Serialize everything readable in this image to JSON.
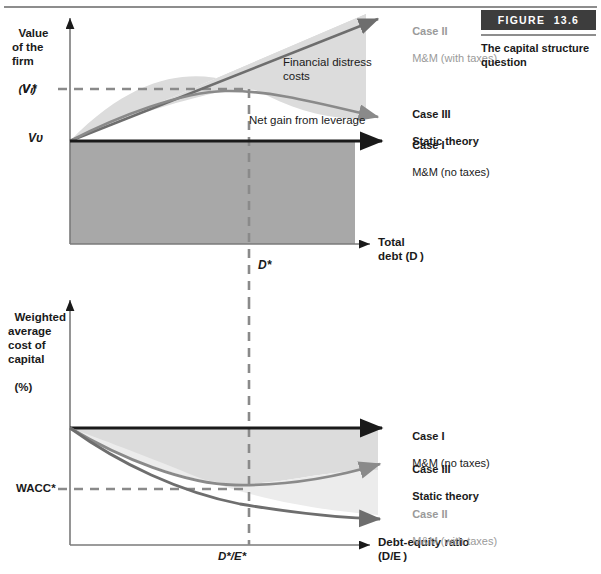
{
  "figure": {
    "badge_label": "FIGURE",
    "badge_number": "13.6",
    "caption": "The capital structure question"
  },
  "top_chart": {
    "y_axis_label_lines": [
      "Value",
      "of the",
      "firm"
    ],
    "y_axis_label_symbol": "(Vₗ)",
    "y_tick_vl": "Vₗ*",
    "y_tick_vu": "Vᴜ",
    "x_tick_dstar": "D*",
    "x_axis_label_lines": [
      "Total",
      "debt (D )"
    ],
    "annotation_distress": "Financial distress\ncosts",
    "annotation_netgain": "Net gain from leverage",
    "case2_line1": "Case II",
    "case2_line2": "M&M (with taxes)",
    "case3_line1": "Case III",
    "case3_line2": "Static theory",
    "case1_line1": "Case I",
    "case1_line2": "M&M (no taxes)"
  },
  "bottom_chart": {
    "y_axis_label_lines": [
      "Weighted",
      "average",
      "cost of",
      "capital"
    ],
    "y_axis_label_symbol": "(%)",
    "y_tick_wacc": "WACC*",
    "x_tick_destar": "D*/E*",
    "x_axis_label_lines": [
      "Debt-equity ratio",
      "(D/E )"
    ],
    "case1_line1": "Case I",
    "case1_line2": "M&M (no taxes)",
    "case3_line1": "Case III",
    "case3_line2": "Static theory",
    "case2_line1": "Case II",
    "case2_line2": "M&M (with taxes)"
  },
  "colors": {
    "dark_fill": "#a8a8a8",
    "light_fill": "#dcdcdc",
    "case1_stroke": "#1a1a1a",
    "case2_stroke": "#6e6e6e",
    "case3_stroke": "#8a8a8a",
    "dash_color": "#8a8a8a",
    "badge_bg": "#3d3d3d",
    "gray_text": "#9a9a9a",
    "rule": "#8d8d8d"
  },
  "chart_data": {
    "type": "line",
    "charts": [
      {
        "name": "value-of-firm-vs-debt",
        "title": "Value of the firm (V_L) vs Total debt (D)",
        "xlabel": "Total debt (D)",
        "ylabel": "Value of the firm (V_L)",
        "grid": false,
        "xlim": [
          0,
          1
        ],
        "ylim": [
          0,
          1
        ],
        "x_ticks": [
          {
            "value": 0.52,
            "label": "D*"
          }
        ],
        "y_ticks": [
          {
            "value": 0.53,
            "label": "V_L*"
          },
          {
            "value": 0.0,
            "label": "V_U"
          }
        ],
        "series": [
          {
            "name": "Case I - M&M (no taxes)",
            "color": "#1a1a1a",
            "x": [
              0,
              0.25,
              0.5,
              0.75,
              1.0
            ],
            "y": [
              0,
              0,
              0,
              0,
              0
            ]
          },
          {
            "name": "Case II - M&M (with taxes)",
            "color": "#6e6e6e",
            "x": [
              0,
              0.25,
              0.5,
              0.75,
              1.0
            ],
            "y": [
              0,
              0.29,
              0.57,
              0.86,
              1.14
            ]
          },
          {
            "name": "Case III - Static theory",
            "color": "#8a8a8a",
            "x": [
              0,
              0.13,
              0.26,
              0.39,
              0.52,
              0.65,
              0.78,
              0.9,
              1.0
            ],
            "y": [
              0,
              0.2,
              0.36,
              0.48,
              0.535,
              0.52,
              0.47,
              0.4,
              0.33
            ]
          }
        ],
        "annotations": [
          {
            "text": "Financial distress costs",
            "x": 0.62,
            "y": 0.84
          },
          {
            "text": "Net gain from leverage",
            "x": 0.56,
            "y": 0.32
          }
        ],
        "shaded_regions": [
          {
            "name": "net gain from leverage (dark)",
            "fill": "#a8a8a8",
            "between": [
              "baseline V_U",
              "x-axis"
            ]
          },
          {
            "name": "financial distress costs (light)",
            "fill": "#dcdcdc",
            "between": [
              "Case II",
              "Case III"
            ]
          }
        ]
      },
      {
        "name": "wacc-vs-debt-equity",
        "title": "Weighted average cost of capital (%) vs Debt-equity ratio (D/E)",
        "xlabel": "Debt-equity ratio (D/E)",
        "ylabel": "Weighted average cost of capital (%)",
        "grid": false,
        "xlim": [
          0,
          1
        ],
        "ylim": [
          0,
          1
        ],
        "x_ticks": [
          {
            "value": 0.52,
            "label": "D*/E*"
          }
        ],
        "y_ticks": [
          {
            "value": 0.47,
            "label": "WACC*"
          }
        ],
        "series": [
          {
            "name": "Case I - M&M (no taxes)",
            "color": "#1a1a1a",
            "x": [
              0,
              0.25,
              0.5,
              0.75,
              1.0
            ],
            "y": [
              1.0,
              1.0,
              1.0,
              1.0,
              1.0
            ]
          },
          {
            "name": "Case III - Static theory",
            "color": "#8a8a8a",
            "x": [
              0,
              0.13,
              0.26,
              0.39,
              0.52,
              0.65,
              0.78,
              0.9,
              1.0
            ],
            "y": [
              1.0,
              0.81,
              0.66,
              0.55,
              0.5,
              0.51,
              0.56,
              0.63,
              0.7
            ]
          },
          {
            "name": "Case II - M&M (with taxes)",
            "color": "#6e6e6e",
            "x": [
              0,
              0.13,
              0.26,
              0.39,
              0.52,
              0.65,
              0.78,
              0.9,
              1.0
            ],
            "y": [
              1.0,
              0.78,
              0.59,
              0.44,
              0.33,
              0.25,
              0.19,
              0.15,
              0.12
            ]
          }
        ],
        "shaded_regions": [
          {
            "name": "between Case I and Case III (light)",
            "fill": "#dcdcdc",
            "between": [
              "Case I",
              "Case III"
            ]
          },
          {
            "name": "between Case III and Case II (lighter)",
            "fill": "#ececec",
            "between": [
              "Case III",
              "Case II"
            ]
          }
        ]
      }
    ]
  }
}
